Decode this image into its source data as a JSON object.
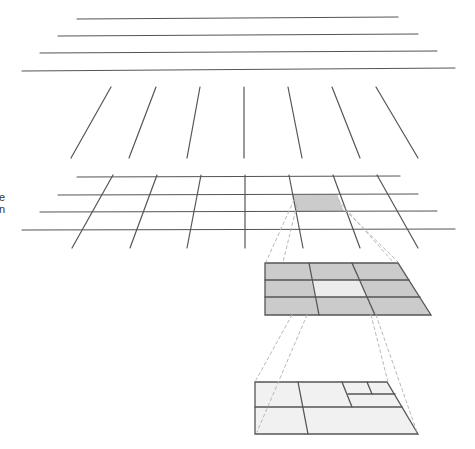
{
  "diagram": {
    "type": "perspective-grid-hierarchy",
    "colors": {
      "line": "#555555",
      "shaded": "#cbcbcb",
      "light": "#ececec",
      "lighter": "#f1f1f1",
      "dashed": "#b8b8b8",
      "background": "#ffffff"
    },
    "edge_label_fragments": [
      "e",
      "n"
    ],
    "layers": [
      {
        "name": "horizontal-lines-layer",
        "lines": [
          [
            77,
            19,
            398,
            17
          ],
          [
            58,
            36,
            418,
            34
          ],
          [
            40,
            53,
            437,
            51
          ],
          [
            22,
            71,
            455,
            68
          ]
        ]
      },
      {
        "name": "vertical-lines-layer",
        "lines": [
          [
            111,
            87,
            71,
            158
          ],
          [
            156,
            87,
            129,
            158
          ],
          [
            200,
            87,
            187,
            158
          ],
          [
            244,
            87,
            244,
            158
          ],
          [
            288,
            87,
            302,
            158
          ],
          [
            332,
            87,
            360,
            158
          ],
          [
            376,
            87,
            418,
            158
          ]
        ]
      },
      {
        "name": "grid-layer",
        "hlines": [
          [
            77,
            177,
            400,
            176
          ],
          [
            58,
            195,
            418,
            194
          ],
          [
            40,
            212,
            437,
            211
          ],
          [
            22,
            230,
            455,
            229
          ]
        ],
        "vlines": [
          [
            113,
            175,
            72,
            248
          ],
          [
            157,
            175,
            130,
            248
          ],
          [
            201,
            175,
            187,
            248
          ],
          [
            245,
            175,
            245,
            248
          ],
          [
            289,
            175,
            303,
            248
          ],
          [
            333,
            175,
            360,
            248
          ],
          [
            377,
            175,
            418,
            248
          ]
        ],
        "shaded_cell": [
          [
            292,
            195
          ],
          [
            337,
            194
          ],
          [
            344,
            211
          ],
          [
            296,
            212
          ]
        ]
      },
      {
        "name": "middle-grid",
        "outline": [
          [
            265,
            263
          ],
          [
            398,
            263
          ],
          [
            431,
            315
          ],
          [
            265,
            315
          ]
        ],
        "center_cell": [
          [
            311,
            280
          ],
          [
            360,
            280
          ],
          [
            368,
            297
          ],
          [
            315,
            297
          ]
        ],
        "hlines": [
          [
            265,
            280
          ],
          [
            409,
            280
          ],
          [
            265,
            297
          ],
          [
            420,
            297
          ]
        ],
        "vlines": [
          [
            309,
            263,
            319,
            315
          ],
          [
            352,
            263,
            375,
            315
          ]
        ]
      },
      {
        "name": "bottom-quadtree",
        "outline": [
          [
            255,
            382
          ],
          [
            387,
            382
          ],
          [
            418,
            434
          ],
          [
            255,
            434
          ]
        ],
        "lines": [
          [
            255,
            407,
            402,
            407
          ],
          [
            298,
            382,
            308,
            434
          ],
          [
            342,
            382,
            352,
            407
          ],
          [
            348,
            394,
            395,
            394
          ],
          [
            367,
            382,
            372,
            394
          ]
        ]
      }
    ],
    "dashed_connectors": [
      [
        294,
        200,
        266,
        262
      ],
      [
        297,
        205,
        283,
        262
      ],
      [
        338,
        200,
        393,
        262
      ],
      [
        345,
        210,
        398,
        262
      ],
      [
        292,
        315,
        256,
        380
      ],
      [
        307,
        315,
        257,
        432
      ],
      [
        371,
        315,
        388,
        382
      ],
      [
        376,
        315,
        417,
        432
      ]
    ]
  }
}
